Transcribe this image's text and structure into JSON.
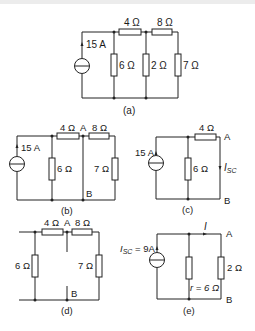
{
  "figure": {
    "panels": [
      {
        "id": "a",
        "caption": "(a)",
        "source": {
          "label": "15 A",
          "type": "current-source"
        },
        "resistors": [
          {
            "name": "R4",
            "label": "4 Ω",
            "orientation": "horizontal"
          },
          {
            "name": "R8",
            "label": "8 Ω",
            "orientation": "horizontal"
          },
          {
            "name": "R6",
            "label": "6 Ω",
            "orientation": "vertical"
          },
          {
            "name": "R2",
            "label": "2 Ω",
            "orientation": "vertical"
          },
          {
            "name": "R7",
            "label": "7 Ω",
            "orientation": "vertical"
          }
        ]
      },
      {
        "id": "b",
        "caption": "(b)",
        "source": {
          "label": "15 A",
          "type": "current-source"
        },
        "nodes": {
          "a": "A",
          "b": "B"
        },
        "resistors": [
          {
            "name": "R4",
            "label": "4 Ω"
          },
          {
            "name": "R8",
            "label": "8 Ω"
          },
          {
            "name": "R6",
            "label": "6 Ω"
          },
          {
            "name": "R7",
            "label": "7 Ω"
          }
        ]
      },
      {
        "id": "c",
        "caption": "(c)",
        "source": {
          "label": "15 A",
          "type": "current-source"
        },
        "nodes": {
          "a": "A",
          "b": "B"
        },
        "current_label": "I",
        "current_sub": "SC",
        "resistors": [
          {
            "name": "R4",
            "label": "4 Ω"
          },
          {
            "name": "R6",
            "label": "6 Ω"
          }
        ]
      },
      {
        "id": "d",
        "caption": "(d)",
        "nodes": {
          "a": "A",
          "b": "B"
        },
        "resistors": [
          {
            "name": "R4",
            "label": "4 Ω"
          },
          {
            "name": "R8",
            "label": "8 Ω"
          },
          {
            "name": "R6",
            "label": "6 Ω"
          },
          {
            "name": "R7",
            "label": "7 Ω"
          }
        ]
      },
      {
        "id": "e",
        "caption": "(e)",
        "source": {
          "label_prefix": "I",
          "label_sub": "SC",
          "label_suffix": " = 9A",
          "type": "current-source"
        },
        "nodes": {
          "a": "A",
          "b": "B"
        },
        "current_label": "I",
        "resistors": [
          {
            "name": "r",
            "label": "r = 6 Ω"
          },
          {
            "name": "R2",
            "label": "2 Ω"
          }
        ]
      }
    ]
  }
}
